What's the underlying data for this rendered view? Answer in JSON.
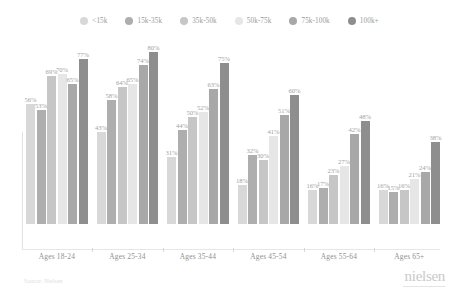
{
  "legend": {
    "items": [
      {
        "label": "<15k",
        "color": "#d8d8d8",
        "swatch_icon": "circle-swatch-icon"
      },
      {
        "label": "15k-35k",
        "color": "#aeaeae",
        "swatch_icon": "circle-swatch-icon"
      },
      {
        "label": "35k-50k",
        "color": "#c6c6c6",
        "swatch_icon": "circle-swatch-icon"
      },
      {
        "label": "50k-75k",
        "color": "#e6e6e6",
        "swatch_icon": "circle-swatch-icon"
      },
      {
        "label": "75k-100k",
        "color": "#a8a8a8",
        "swatch_icon": "circle-swatch-icon"
      },
      {
        "label": "100k+",
        "color": "#8e8e8e",
        "swatch_icon": "circle-swatch-icon"
      }
    ]
  },
  "footer": {
    "source": "Source: Nielsen",
    "brand": "nielsen"
  },
  "chart_data": {
    "type": "bar",
    "title": "",
    "xlabel": "",
    "ylabel": "",
    "ylim": [
      0,
      100
    ],
    "grid": false,
    "legend_position": "top-center",
    "value_suffix": "%",
    "categories": [
      "Ages 18-24",
      "Ages 25-34",
      "Ages 35-44",
      "Ages 45-54",
      "Ages 55-64",
      "Ages 65+"
    ],
    "series": [
      {
        "name": "<15k",
        "color": "#d8d8d8",
        "values": [
          56,
          43,
          31,
          18,
          16,
          16
        ]
      },
      {
        "name": "15k-35k",
        "color": "#aeaeae",
        "values": [
          53,
          58,
          44,
          32,
          17,
          15
        ]
      },
      {
        "name": "35k-50k",
        "color": "#c6c6c6",
        "values": [
          69,
          64,
          50,
          30,
          23,
          16
        ]
      },
      {
        "name": "50k-75k",
        "color": "#e6e6e6",
        "values": [
          70,
          65,
          52,
          41,
          27,
          21
        ]
      },
      {
        "name": "75k-100k",
        "color": "#a8a8a8",
        "values": [
          65,
          74,
          63,
          51,
          42,
          24
        ]
      },
      {
        "name": "100k+",
        "color": "#8e8e8e",
        "values": [
          77,
          80,
          75,
          60,
          48,
          38
        ]
      }
    ]
  }
}
